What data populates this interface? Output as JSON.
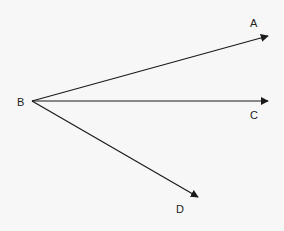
{
  "diagram": {
    "type": "rays-from-point",
    "background": "#f7f7f7",
    "stroke_color": "#1a1a1a",
    "origin": {
      "label": "B",
      "x": 32,
      "y": 101,
      "label_x": 17,
      "label_y": 106
    },
    "rays": [
      {
        "label": "A",
        "x2": 268,
        "y2": 36,
        "label_x": 250,
        "label_y": 27
      },
      {
        "label": "C",
        "x2": 268,
        "y2": 101,
        "label_x": 250,
        "label_y": 119
      },
      {
        "label": "D",
        "x2": 198,
        "y2": 197,
        "label_x": 176,
        "label_y": 213
      }
    ]
  }
}
